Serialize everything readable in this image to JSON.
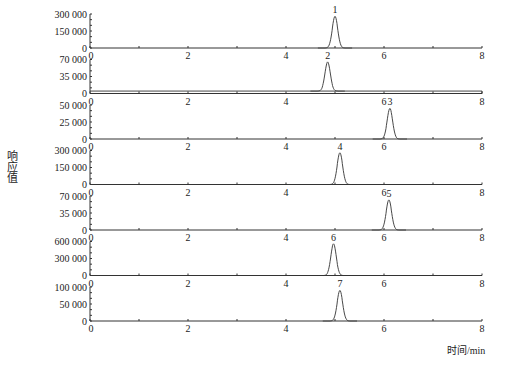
{
  "chart_data": {
    "type": "line",
    "title": "",
    "xlabel": "时间/min",
    "ylabel": "响应值",
    "xlim": [
      0,
      8
    ],
    "x_ticks": [
      "0",
      "2",
      "4",
      "6",
      "8"
    ],
    "grid": false,
    "legend": null,
    "panels": [
      {
        "peak_label": "1",
        "retention_time": 5.0,
        "peak_height": 280000,
        "y_ticks": [
          "0",
          "150 000",
          "300 000"
        ],
        "ylim": [
          0,
          300000
        ]
      },
      {
        "peak_label": "2",
        "retention_time": 4.85,
        "peak_height": 60000,
        "y_ticks": [
          "0",
          "35 000",
          "70 000"
        ],
        "ylim": [
          0,
          70000
        ],
        "baseline": 5000
      },
      {
        "peak_label": "3",
        "retention_time": 6.12,
        "peak_height": 45000,
        "y_ticks": [
          "0",
          "25 000",
          "50 000"
        ],
        "ylim": [
          0,
          50000
        ]
      },
      {
        "peak_label": "4",
        "retention_time": 5.1,
        "peak_height": 280000,
        "y_ticks": [
          "0",
          "150 000",
          "300 000"
        ],
        "ylim": [
          0,
          300000
        ]
      },
      {
        "peak_label": "5",
        "retention_time": 6.1,
        "peak_height": 62000,
        "y_ticks": [
          "0",
          "35 000",
          "70 000"
        ],
        "ylim": [
          0,
          70000
        ]
      },
      {
        "peak_label": "6",
        "retention_time": 4.97,
        "peak_height": 560000,
        "y_ticks": [
          "0",
          "300 000",
          "600 000"
        ],
        "ylim": [
          0,
          600000
        ]
      },
      {
        "peak_label": "7",
        "retention_time": 5.1,
        "peak_height": 90000,
        "y_ticks": [
          "0",
          "50 000",
          "100 000"
        ],
        "ylim": [
          0,
          100000
        ]
      }
    ]
  }
}
